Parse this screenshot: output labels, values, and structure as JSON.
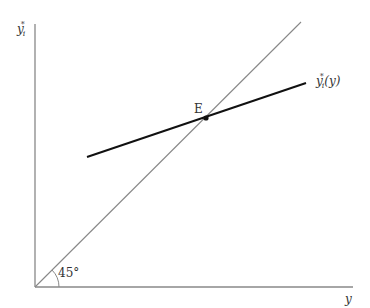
{
  "diagram": {
    "y_axis_label": {
      "base": "y",
      "sub": "i",
      "sup": "*"
    },
    "x_axis_label": "y",
    "reaction_curve_label": {
      "base": "y",
      "sub": "i",
      "sup": "*",
      "arg": "(y)"
    },
    "equilibrium_label": "E",
    "angle_label": "45°",
    "colors": {
      "axis": "#888888",
      "diagonal": "#888888",
      "reaction_curve": "#111111"
    }
  }
}
